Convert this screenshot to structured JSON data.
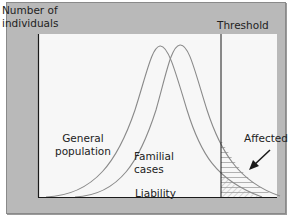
{
  "diagram": {
    "y_axis_label_lines": [
      "Number of",
      "individuals"
    ],
    "x_axis_label": "Liability",
    "threshold_label": "Threshold",
    "curves": [
      {
        "name": "General population",
        "label_lines": [
          "General",
          "population"
        ],
        "color": "#8a8a8a"
      },
      {
        "name": "Familial cases",
        "label_lines": [
          "Familial",
          "cases"
        ],
        "color": "#8a8a8a"
      }
    ],
    "affected_label": "Affected",
    "colors": {
      "panel_background": "#b9b9b9",
      "plot_background": "#f7f7f7",
      "axis": "#1a1a1a",
      "curve": "#8a8a8a",
      "hatch": "#9a9a9a"
    }
  }
}
